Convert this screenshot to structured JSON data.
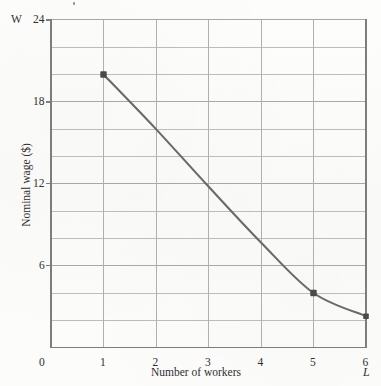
{
  "figure": {
    "kind": "line-graph",
    "background_color": "#fdfdfc",
    "grid_color": "#b9b9b9",
    "axis_color": "#8d8d8d",
    "curve_color": "#6a6a6a",
    "marker_color": "#4a4a4a"
  },
  "axes": {
    "y_symbol": "W",
    "x_symbol": "L",
    "y_title": "Nominal wage ($)",
    "x_title": "Number of workers",
    "y_ticks": [
      "24",
      "18",
      "12",
      "6"
    ],
    "y_tick_values": [
      24,
      18,
      12,
      6
    ],
    "x_ticks": [
      "0",
      "1",
      "2",
      "3",
      "4",
      "5",
      "6"
    ],
    "x_tick_values": [
      0,
      1,
      2,
      3,
      4,
      5,
      6
    ],
    "origin_label": "0"
  },
  "chart_data": {
    "type": "line",
    "title": "",
    "subtitle": "",
    "xlabel": "Number of workers",
    "ylabel": "Nominal wage ($)",
    "xlim": [
      0,
      6
    ],
    "ylim": [
      0,
      24
    ],
    "x_symbol": "W",
    "y_symbol": "L",
    "grid": true,
    "grid_x_step": 1,
    "grid_y_step": 2,
    "legend": "none",
    "series": [
      {
        "name": "Labour demand curve",
        "color": "#6a6a6a",
        "x": [
          1,
          2,
          3,
          4,
          5,
          6
        ],
        "values": [
          20,
          16,
          11.8,
          7.7,
          4,
          2.3
        ]
      }
    ],
    "markers": [
      {
        "label": "point-a",
        "x": 1,
        "y": 20
      },
      {
        "label": "point-b",
        "x": 5,
        "y": 4
      },
      {
        "label": "point-c",
        "x": 6,
        "y": 2.3
      }
    ]
  }
}
